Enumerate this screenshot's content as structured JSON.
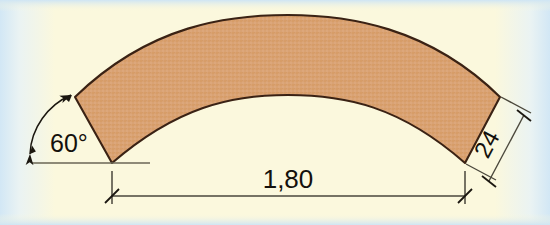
{
  "diagram": {
    "background_color": "#fbf8dd",
    "margin_color": "#dbeaf6",
    "shape": {
      "name": "curved-arc-band",
      "fill_color": "#d9a273",
      "stroke_color": "#3a2214",
      "texture": "fine cross-hatch speckle"
    },
    "annotations": {
      "angle": {
        "label": "60°",
        "name": "angle-dimension",
        "color": "#14110c"
      },
      "span": {
        "label": "1,80",
        "name": "span-dimension",
        "color": "#14110c"
      },
      "width": {
        "label": "24",
        "name": "width-dimension",
        "color": "#14110c",
        "rotation_deg": -62
      }
    },
    "lines": {
      "baseline_color": "#5d5a4a",
      "dimension_color": "#3c3a30",
      "tick_style": "slash"
    }
  }
}
